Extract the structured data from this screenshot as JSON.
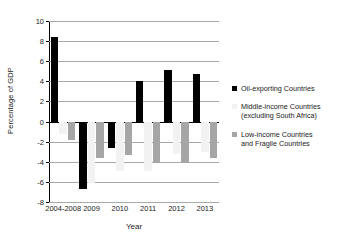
{
  "chart_data": {
    "type": "bar",
    "title": "",
    "xlabel": "Year",
    "ylabel": "Percentage of GDP",
    "categories": [
      "2004-2008",
      "2009",
      "2010",
      "2011",
      "2012",
      "2013"
    ],
    "ylim": [
      -8,
      10
    ],
    "ytick_labels": [
      "10",
      "8",
      "6",
      "4",
      "2",
      "0",
      "-2",
      "-4",
      "-6",
      "-8"
    ],
    "ytick_values": [
      10,
      8,
      6,
      4,
      2,
      0,
      -2,
      -4,
      -6,
      -8
    ],
    "grid": true,
    "legend_position": "right",
    "series": [
      {
        "name": "Oil-exporting Countries",
        "color": "#000000",
        "values": [
          8.4,
          -6.7,
          -2.6,
          4.0,
          5.1,
          4.7
        ]
      },
      {
        "name": "Middle-income Countries (excluding South Africa)",
        "color": "#f2f2f2",
        "values": [
          -1.2,
          -6.1,
          -4.9,
          -4.9,
          -3.2,
          -3.0
        ]
      },
      {
        "name": "Low-income Countries and Fragile Countries",
        "color": "#a6a6a6",
        "values": [
          -1.8,
          -3.6,
          -3.3,
          -4.1,
          -4.1,
          -3.6
        ]
      }
    ]
  },
  "legend": {
    "entries": [
      {
        "lines": [
          "Oil-exporting Countries"
        ],
        "swatch": "series-oil"
      },
      {
        "lines": [
          "Middle-income Countries",
          "(excluding South Africa)"
        ],
        "swatch": "series-middle"
      },
      {
        "lines": [
          "Low-income Countries",
          "and Fragile Countries"
        ],
        "swatch": "series-low"
      }
    ]
  },
  "colors": {
    "oil": "#000000",
    "middle": "#f2f2f2",
    "low": "#a6a6a6",
    "gridline": "#a9a9a9",
    "axis": "#000000"
  }
}
